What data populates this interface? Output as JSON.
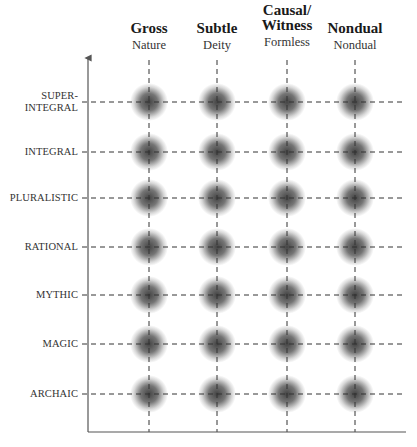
{
  "columns": [
    {
      "title": "Gross",
      "subtitle": "Nature",
      "x": 149
    },
    {
      "title": "Subtle",
      "subtitle": "Deity",
      "x": 217
    },
    {
      "title": "Causal/ Witness",
      "title_line1": "Causal/",
      "title_line2": "Witness",
      "subtitle": "Formless",
      "x": 287
    },
    {
      "title": "Nondual",
      "subtitle": "Nondual",
      "x": 355
    }
  ],
  "rows": [
    {
      "label": "SUPER- INTEGRAL",
      "label_line1": "SUPER-",
      "label_line2": "INTEGRAL",
      "y": 102
    },
    {
      "label": "INTEGRAL",
      "y": 152
    },
    {
      "label": "PLURALISTIC",
      "y": 198
    },
    {
      "label": "RATIONAL",
      "y": 247
    },
    {
      "label": "MYTHIC",
      "y": 295
    },
    {
      "label": "MAGIC",
      "y": 344
    },
    {
      "label": "ARCHAIC",
      "y": 394
    }
  ],
  "axes": {
    "x0": 88,
    "y_top": 58,
    "y_bottom": 432,
    "x_right": 406
  },
  "colors": {
    "axis": "#555555",
    "dash": "#333333",
    "blob": "#3a3a3a"
  },
  "chart_data": {
    "type": "heatmap",
    "title": "",
    "x_categories": [
      "Gross (Nature)",
      "Subtle (Deity)",
      "Causal/Witness (Formless)",
      "Nondual (Nondual)"
    ],
    "y_categories": [
      "ARCHAIC",
      "MAGIC",
      "MYTHIC",
      "RATIONAL",
      "PLURALISTIC",
      "INTEGRAL",
      "SUPER-INTEGRAL"
    ],
    "values": [
      [
        1,
        1,
        1,
        1
      ],
      [
        1,
        1,
        1,
        1
      ],
      [
        1,
        1,
        1,
        1
      ],
      [
        1,
        1,
        1,
        1
      ],
      [
        1,
        1,
        1,
        1
      ],
      [
        1,
        1,
        1,
        1
      ],
      [
        1,
        1,
        1,
        1
      ]
    ],
    "grid": "dashed",
    "xlabel": "States",
    "ylabel": "Stages"
  }
}
